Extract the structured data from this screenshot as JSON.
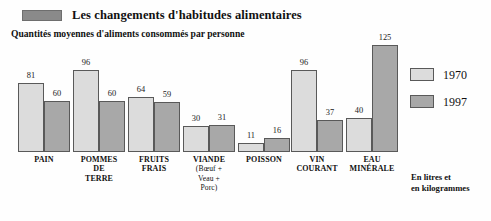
{
  "header": {
    "title": "Les changements d'habitudes alimentaires",
    "subtitle": "Quantités moyennes d'aliments consommés par personne",
    "marker_color": "#8a8a8a"
  },
  "legend": {
    "items": [
      {
        "label": "1970",
        "color": "#dcdcdc"
      },
      {
        "label": "1997",
        "color": "#a8a8a8"
      }
    ]
  },
  "footnote": {
    "line1": "En litres et",
    "line2": "en kilogrammes"
  },
  "colors": {
    "series_1970": "#dcdcdc",
    "series_1997": "#a8a8a8",
    "bar_outline": "#595959",
    "text": "#111111",
    "background": "#fefefe"
  },
  "chart_data": {
    "type": "bar",
    "title": "Les changements d'habitudes alimentaires",
    "subtitle": "Quantités moyennes d'aliments consommés par personne",
    "xlabel": "",
    "ylabel": "En litres et en kilogrammes",
    "ylim": [
      0,
      125
    ],
    "grid": false,
    "legend_position": "right",
    "categories": [
      "PAIN",
      "POMMES DE TERRE",
      "FRUITS FRAIS",
      "VIANDE (Boeuf + Veau + Porc)",
      "POISSON",
      "VIN COURANT",
      "EAU MINÉRALE"
    ],
    "category_labels": [
      {
        "main": "PAIN",
        "sub": ""
      },
      {
        "main": "POMMES\nDE\nTERRE",
        "sub": ""
      },
      {
        "main": "FRUITS\nFRAIS",
        "sub": ""
      },
      {
        "main": "VIANDE",
        "sub": "(Bœuf +\nVeau +\nPorc)"
      },
      {
        "main": "POISSON",
        "sub": ""
      },
      {
        "main": "VIN\nCOURANT",
        "sub": ""
      },
      {
        "main": "EAU\nMINÉRALE",
        "sub": ""
      }
    ],
    "series": [
      {
        "name": "1970",
        "values": [
          81,
          96,
          64,
          30,
          11,
          96,
          40
        ]
      },
      {
        "name": "1997",
        "values": [
          60,
          60,
          59,
          31,
          16,
          37,
          125
        ]
      }
    ]
  },
  "layout": {
    "baseline_y": 152,
    "px_per_unit": 0.855,
    "groups": [
      {
        "x": 18,
        "bar_w": 26
      },
      {
        "x": 73,
        "bar_w": 26
      },
      {
        "x": 128,
        "bar_w": 26
      },
      {
        "x": 183,
        "bar_w": 26
      },
      {
        "x": 238,
        "bar_w": 26
      },
      {
        "x": 291,
        "bar_w": 26
      },
      {
        "x": 346,
        "bar_w": 26
      }
    ]
  }
}
